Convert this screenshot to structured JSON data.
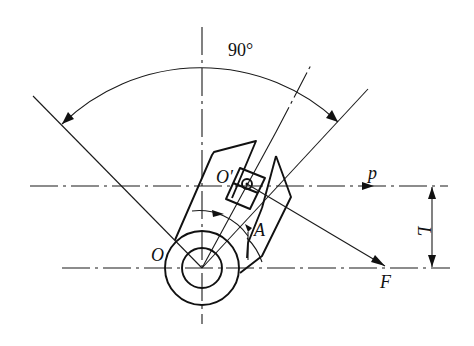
{
  "figure": {
    "type": "mechanical-technical-drawing"
  },
  "labels": {
    "angle": "90°",
    "pivot_main": "O",
    "pivot_secondary": "O′",
    "point_a": "A",
    "force_p": "p",
    "force_f": "F",
    "distance": "L"
  },
  "colors": {
    "line": "#1a1a1a",
    "background": "#ffffff"
  }
}
